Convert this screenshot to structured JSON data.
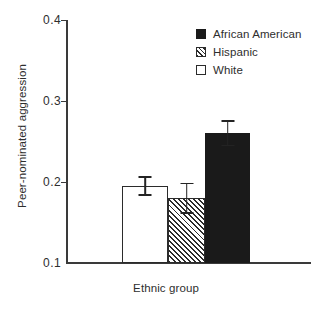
{
  "chart_data": {
    "type": "bar",
    "title": "",
    "xlabel": "Ethnic group",
    "ylabel": "Peer-nominated aggression",
    "ylim": [
      0.1,
      0.4
    ],
    "yticks": [
      "0.1",
      "0.2",
      "0.3",
      "0.4"
    ],
    "ytick_values": [
      0.1,
      0.2,
      0.3,
      0.4
    ],
    "grid": false,
    "legend_position": "top-right",
    "categories": [
      "White",
      "Hispanic",
      "African American"
    ],
    "values": [
      0.195,
      0.18,
      0.26
    ],
    "errors": [
      0.012,
      0.019,
      0.016
    ],
    "bars": [
      {
        "category": "White",
        "value": 0.195,
        "error": 0.012,
        "error_low": 0.183,
        "error_high": 0.207,
        "fill": "open"
      },
      {
        "category": "Hispanic",
        "value": 0.18,
        "error": 0.019,
        "error_low": 0.161,
        "error_high": 0.199,
        "fill": "hatch"
      },
      {
        "category": "African American",
        "value": 0.26,
        "error": 0.016,
        "error_low": 0.244,
        "error_high": 0.276,
        "fill": "solid"
      }
    ],
    "legend": [
      {
        "label": "African American",
        "fill": "solid"
      },
      {
        "label": "Hispanic",
        "fill": "hatch"
      },
      {
        "label": "White",
        "fill": "open"
      }
    ],
    "colors": {
      "solid": "#1a1a1a",
      "open": "#ffffff",
      "outline": "#2b2b2b",
      "axis": "#3a3a3a",
      "text": "#2e2e2e",
      "background": "#ffffff"
    }
  }
}
